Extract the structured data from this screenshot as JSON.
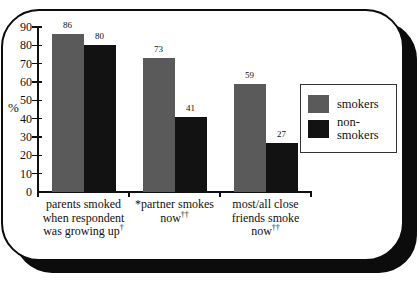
{
  "chart_data": {
    "type": "bar",
    "title": "",
    "xlabel": "",
    "ylabel": "%",
    "ylim": [
      0,
      90
    ],
    "ytick_step": 10,
    "ytick_labels": [
      "0",
      "10",
      "20",
      "30",
      "40",
      "50",
      "60",
      "70",
      "80",
      "90"
    ],
    "grid": false,
    "legend_position": "right",
    "categories": [
      "parents smoked when respondent was growing up†",
      "*partner smokes now††",
      "most/all close friends smoke now††"
    ],
    "category_labels": [
      {
        "lines": [
          {
            "text": "parents smoked"
          },
          {
            "text": "when respondent"
          },
          {
            "text": "was growing up",
            "sup": "†"
          }
        ]
      },
      {
        "lines": [
          {
            "text": "*partner smokes"
          },
          {
            "text": "now",
            "sup": "††"
          }
        ]
      },
      {
        "lines": [
          {
            "text": "most/all close"
          },
          {
            "text": "friends smoke"
          },
          {
            "text": "now",
            "sup": "††"
          }
        ]
      }
    ],
    "series": [
      {
        "name": "smokers",
        "color": "#5a5a5a",
        "values": [
          86,
          73,
          59
        ]
      },
      {
        "name": "non-smokers",
        "color": "#121212",
        "values": [
          80,
          41,
          27
        ]
      }
    ]
  },
  "legend": {
    "items": [
      {
        "label": "smokers",
        "color": "#5a5a5a"
      },
      {
        "label": "non-smokers",
        "color": "#121212"
      }
    ]
  },
  "colors": {
    "card_border": "#0c0c0c",
    "card_shadow": "#0c0c0c",
    "axis": "#111111",
    "background": "#ffffff"
  }
}
